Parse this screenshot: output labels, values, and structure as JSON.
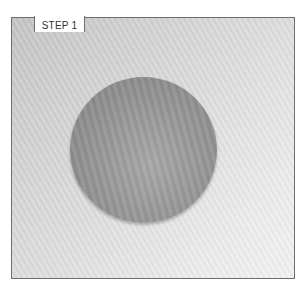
{
  "step_label": "STEP 1",
  "photo": {
    "subject": "round-dough-disc",
    "background": "textured-work-surface"
  },
  "colors": {
    "frame_border": "#6e6e6e",
    "disc": "#999999",
    "surface": "#dcdcdc"
  }
}
